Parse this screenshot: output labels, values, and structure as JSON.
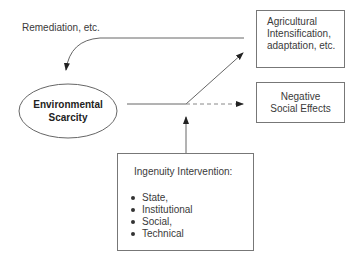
{
  "diagram": {
    "feedback_label": "Remediation, etc.",
    "core_node": {
      "line1": "Environmental",
      "line2": "Scarcity"
    },
    "positive_outcome": {
      "line1": "Agricultural",
      "line2": "Intensification,",
      "line3": "adaptation, etc."
    },
    "negative_outcome": {
      "line1": "Negative",
      "line2": "Social Effects"
    },
    "intervention": {
      "title": "Ingenuity Intervention:",
      "items": [
        "State,",
        "Institutional",
        "Social,",
        "Technical"
      ]
    },
    "colors": {
      "line": "#666666",
      "text": "#333333",
      "border": "#777777"
    }
  }
}
